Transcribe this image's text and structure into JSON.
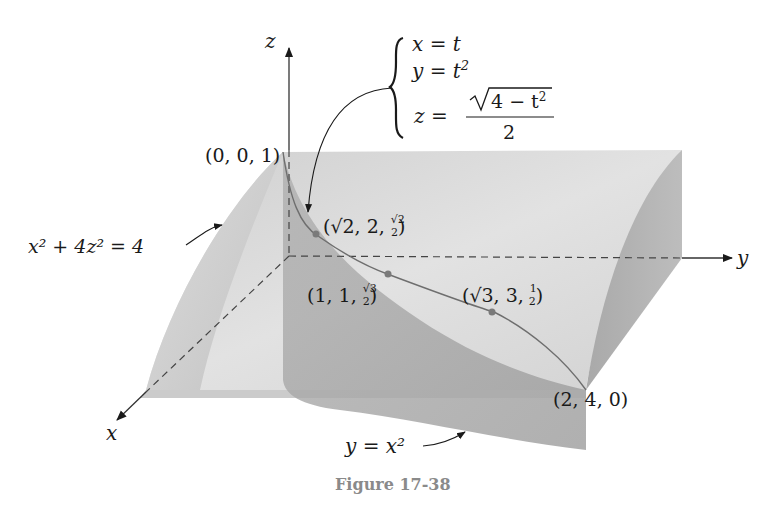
{
  "figure": {
    "caption": "Figure 17-38",
    "axes": {
      "x": "x",
      "y": "y",
      "z": "z"
    },
    "parametric": {
      "x_eq": "x = t",
      "y_lhs": "y = t",
      "y_exp": "2",
      "z_lhs": "z =",
      "z_num": "4 − t",
      "z_num_exp": "2",
      "z_den": "2"
    },
    "surfaces": {
      "cylinder": {
        "label": "x² + 4z² = 4"
      },
      "parabolic": {
        "label": "y = x²"
      }
    },
    "points": [
      {
        "id": "p001",
        "label": "(0, 0, 1)"
      },
      {
        "id": "p_sqrt2",
        "label": "(√2, 2, √2/2)",
        "pre": "(√2, 2, ",
        "frac_num": "√2",
        "frac_den": "2",
        "post": ")"
      },
      {
        "id": "p111",
        "label": "(1, 1, √3/2)",
        "pre": "(1, 1, ",
        "frac_num": "√3",
        "frac_den": "2",
        "post": ")"
      },
      {
        "id": "p_sqrt3",
        "label": "(√3, 3, 1/2)",
        "pre": "(√3, 3, ",
        "frac_num": "1",
        "frac_den": "2",
        "post": ")"
      },
      {
        "id": "p240",
        "label": "(2, 4, 0)"
      }
    ],
    "colors": {
      "surface_light": "#d6d6d6",
      "surface_mid": "#bdbdbd",
      "surface_dark": "#a0a0a0",
      "curve": "#6e6e6e",
      "point": "#7a7a7a",
      "axis": "#333333",
      "caption": "#8a8a8a"
    }
  }
}
